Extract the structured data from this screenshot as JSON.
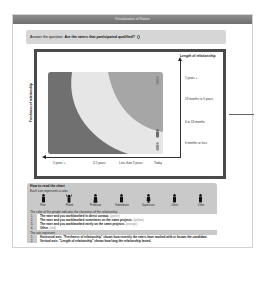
{
  "window": {
    "title": "Visualization of Raters"
  },
  "question": {
    "prefix": "Answer the question:",
    "text": "Are the raters that participated qualified?",
    "icon": "help-circle-icon"
  },
  "chart": {
    "y_title": "Length of relationship",
    "y_ticks": [
      "5 years +",
      "18 months to 5 years",
      "6 to 18 months",
      "6 months or less"
    ],
    "x_ticks": [
      "5 years +",
      "3-5 years",
      "Less than 3 years",
      "Today"
    ],
    "y_axis_label": "Freshness of relationship",
    "colors": {
      "dark_band": "#707070",
      "light_band": "#e6e6e6",
      "mid_band": "#a6a6a6",
      "frame": "#4a4a4a"
    }
  },
  "legend": {
    "title": "How to read the chart",
    "subtitle": "Each icon represents a rater.",
    "icons": [
      {
        "label": "Peer",
        "icon": "person-peer-icon"
      },
      {
        "label": "Friend",
        "icon": "person-friend-icon"
      },
      {
        "label": "Professor",
        "icon": "person-professor-icon"
      },
      {
        "label": "Subordinate",
        "icon": "person-subordinate-icon"
      },
      {
        "label": "Supervisor",
        "icon": "person-supervisor-icon"
      },
      {
        "label": "Client",
        "icon": "person-client-icon"
      },
      {
        "label": "Other",
        "icon": "person-other-icon"
      }
    ],
    "color_note": "The color of the people indicates the closeness of the relationship.",
    "color_items": [
      {
        "n": "1.",
        "text": "The rater and you work/worked in direct contact.",
        "tag": "(green)"
      },
      {
        "n": "2.",
        "text": "The rater and you work/worked sometimes on the same projects.",
        "tag": "(yellow)"
      },
      {
        "n": "3.",
        "text": "The rater and you work/worked rarely on the same projects.",
        "tag": "(orange)"
      },
      {
        "n": "4.",
        "text": "Other.",
        "tag": "(red)"
      }
    ],
    "axis_note": "The axis represent:",
    "axis_items": [
      {
        "n": "1.",
        "text": "Horizontal axis: \"Freshness of relationship\" shows how recently the raters have worked with or known the candidate."
      },
      {
        "n": "2.",
        "text": "Vertical axis: \"Length of relationship\" shows how long the relationship lasted."
      }
    ]
  }
}
